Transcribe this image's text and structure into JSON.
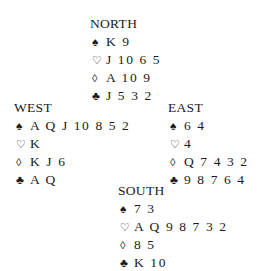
{
  "hands": {
    "north": {
      "label": "NORTH",
      "suits": [
        {
          "icon": "spade-icon",
          "glyph": "♠",
          "cards": "K 9"
        },
        {
          "icon": "heart-icon",
          "glyph": "♡",
          "cards": "J 10 6 5"
        },
        {
          "icon": "diamond-icon",
          "glyph": "◊",
          "cards": "A 10 9"
        },
        {
          "icon": "club-icon",
          "glyph": "♣",
          "cards": "J 5 3 2"
        }
      ]
    },
    "west": {
      "label": "WEST",
      "suits": [
        {
          "icon": "spade-icon",
          "glyph": "♠",
          "cards": "A Q J 10 8 5 2"
        },
        {
          "icon": "heart-icon",
          "glyph": "♡",
          "cards": "K"
        },
        {
          "icon": "diamond-icon",
          "glyph": "◊",
          "cards": "K J 6"
        },
        {
          "icon": "club-icon",
          "glyph": "♣",
          "cards": "A Q"
        }
      ]
    },
    "east": {
      "label": "EAST",
      "suits": [
        {
          "icon": "spade-icon",
          "glyph": "♠",
          "cards": "6 4"
        },
        {
          "icon": "heart-icon",
          "glyph": "♡",
          "cards": "4"
        },
        {
          "icon": "diamond-icon",
          "glyph": "◊",
          "cards": "Q 7 4 3 2"
        },
        {
          "icon": "club-icon",
          "glyph": "♣",
          "cards": "9 8 7 6 4"
        }
      ]
    },
    "south": {
      "label": "SOUTH",
      "suits": [
        {
          "icon": "spade-icon",
          "glyph": "♠",
          "cards": "7 3"
        },
        {
          "icon": "heart-icon",
          "glyph": "♡",
          "cards": "A Q 9 8 7 3 2"
        },
        {
          "icon": "diamond-icon",
          "glyph": "◊",
          "cards": "8 5"
        },
        {
          "icon": "club-icon",
          "glyph": "♣",
          "cards": "K 10"
        }
      ]
    }
  }
}
